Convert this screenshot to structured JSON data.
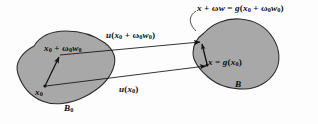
{
  "figure": {
    "kind": "continuum-deformation-diagram",
    "background_color": "#fdfdfd",
    "blob_fill_color": "#a8a8a8",
    "blob_stroke_color": "#2b2b2b",
    "arrow_color": "#111111",
    "text_color": "#0d0d0d",
    "labels": {
      "top_mapped_point": {
        "parts": {
          "x": "x",
          "plus1": " + ",
          "omega": "ω",
          "w": "w",
          "equals": " = ",
          "g": "g",
          "open": "(",
          "x0": "x",
          "sub0_a": "0",
          "plus2": " + ",
          "omega0": "ω",
          "sub0_b": "0",
          "w0": "w",
          "sub0_c": "0",
          "close": ")"
        },
        "plain": "x + ωw = g(x0 + ω0w0)"
      },
      "upper_arrow": {
        "parts": {
          "u": "u",
          "open": "(",
          "x": "x",
          "sub0_a": "0",
          "plus": " + ",
          "omega": "ω",
          "sub0_b": "0",
          "w": "w",
          "sub0_c": "0",
          "close": ")"
        },
        "plain": "u(x0 + ω0w0)"
      },
      "source_point_offset": {
        "parts": {
          "x": "x",
          "sub0_a": "0",
          "plus": " + ",
          "omega": "ω",
          "sub0_b": "0",
          "w": "w",
          "sub0_c": "0"
        },
        "plain": "x0 + ω0w0"
      },
      "source_point": {
        "parts": {
          "x": "x",
          "sub0": "0"
        },
        "plain": "x0"
      },
      "lower_arrow": {
        "parts": {
          "u": "u",
          "open": "(",
          "x": "x",
          "sub0": "0",
          "close": ")"
        },
        "plain": "u(x0)"
      },
      "image_point": {
        "parts": {
          "x": "x",
          "equals": " = ",
          "g": "g",
          "open": "(",
          "x0": "x",
          "sub0": "0",
          "close": ")"
        },
        "plain": "x = g(x0)"
      },
      "deformed_body": {
        "parts": {
          "B": "B"
        },
        "plain": "B"
      },
      "reference_body": {
        "parts": {
          "B": "B",
          "sub0": "0"
        },
        "plain": "B0"
      }
    }
  }
}
